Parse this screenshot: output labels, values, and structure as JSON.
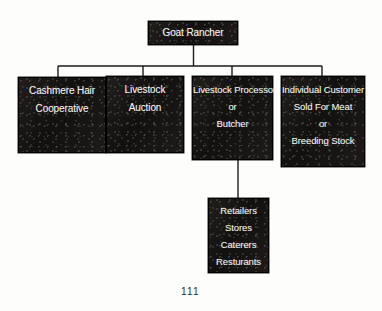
{
  "page": {
    "number": "111",
    "background_color": "#fdfdfc",
    "node_fill_color": "#161412",
    "node_text_color": "#f3f2ef",
    "connector_color": "#1a1a1a"
  },
  "diagram": {
    "type": "organizational-flow-chart",
    "root": {
      "id": "goat-rancher",
      "lines": [
        "Goat Rancher"
      ]
    },
    "children": [
      {
        "id": "cashmere-hair-cooperative",
        "lines": [
          "Cashmere Hair",
          "Cooperative"
        ]
      },
      {
        "id": "livestock-auction",
        "lines": [
          "Livestock",
          "Auction"
        ]
      },
      {
        "id": "livestock-processor-butcher",
        "lines": [
          "Livestock Processor",
          "or",
          "Butcher"
        ]
      },
      {
        "id": "individual-customer",
        "lines": [
          "Individual Customer",
          "Sold For Meat",
          "or",
          "Breeding Stock"
        ]
      }
    ],
    "grandchild": {
      "id": "retailers-stores-caterers-resturants",
      "parent": "livestock-processor-butcher",
      "lines": [
        "Retailers",
        "Stores",
        "Caterers",
        "Resturants"
      ]
    }
  }
}
